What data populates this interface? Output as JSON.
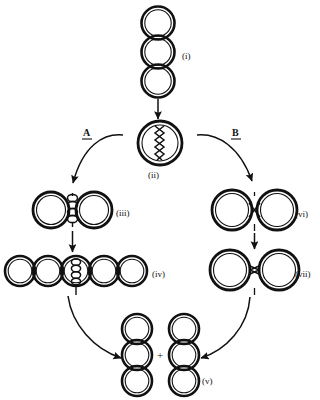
{
  "figure": {
    "background_color": "#ffffff",
    "ink_color": "#111111",
    "width": 320,
    "height": 400
  },
  "branches": [
    {
      "id": "A",
      "label": "A",
      "underlined": true,
      "side": "left"
    },
    {
      "id": "B",
      "label": "B",
      "underlined": true,
      "side": "right"
    }
  ],
  "stages": [
    {
      "id": "i",
      "label": "(i)",
      "label_x": 190,
      "label_y": 60,
      "kind": "vertical-chain",
      "description": "vertical chain of three double-ring circles",
      "circle_count": 3,
      "center_x": 158,
      "center_y": 52,
      "radius": 20
    },
    {
      "id": "ii",
      "label": "(ii)",
      "label_x": 150,
      "label_y": 175,
      "kind": "paired-rings-zigzag",
      "description": "two fused double-rings joined by a zig-zag crossover junction",
      "circle_count": 2,
      "center_x": 160,
      "center_y": 143,
      "radius": 27
    },
    {
      "id": "iii",
      "label": "(iii)",
      "label_x": 120,
      "label_y": 213,
      "kind": "paired-rings-ladder",
      "description": "two double-rings joined by a vertical ladder of linked loops",
      "circle_count": 2,
      "center_x": 72,
      "center_y": 210,
      "radius": 22
    },
    {
      "id": "iv",
      "label": "(iv)",
      "label_x": 155,
      "label_y": 274,
      "kind": "horizontal-chain-ladder",
      "description": "horizontal chain of five double-rings with a ladder junction at centre",
      "circle_count": 5,
      "center_x": 76,
      "center_y": 271,
      "radius": 19
    },
    {
      "id": "vi",
      "label": "(vi)",
      "label_x": 297,
      "label_y": 214,
      "kind": "paired-rings-cross",
      "description": "two touching double-rings with a small X crossing point",
      "circle_count": 2,
      "center_x": 255,
      "center_y": 210,
      "radius": 24
    },
    {
      "id": "vii",
      "label": "(vii)",
      "label_x": 297,
      "label_y": 274,
      "kind": "paired-rings-pinch",
      "description": "two double-rings meeting at a narrow pinch point",
      "circle_count": 2,
      "center_x": 255,
      "center_y": 270,
      "radius": 24
    },
    {
      "id": "v",
      "label": "(v)",
      "label_x": 205,
      "label_y": 380,
      "kind": "two-vertical-chains",
      "description": "two separate vertical chains of three double-rings joined by a plus sign",
      "circle_count": 6,
      "center_x": 160,
      "center_y": 355,
      "radius": 18
    }
  ],
  "plus_sign": {
    "text": "+",
    "x": 160,
    "y": 352
  },
  "arrows": [
    {
      "id": "arrow-i-to-ii",
      "from": "i",
      "to": "ii",
      "style": "straight",
      "direction": "down"
    },
    {
      "id": "arrow-ii-to-iii",
      "from": "ii",
      "to": "iii",
      "style": "curved",
      "direction": "down-left",
      "branch": "A"
    },
    {
      "id": "arrow-iii-to-iv",
      "from": "iii",
      "to": "iv",
      "style": "straight",
      "direction": "down"
    },
    {
      "id": "arrow-iv-to-v",
      "from": "iv",
      "to": "v",
      "style": "curved",
      "direction": "down-right"
    },
    {
      "id": "arrow-ii-to-vi",
      "from": "ii",
      "to": "vi",
      "style": "curved",
      "direction": "down-right",
      "branch": "B"
    },
    {
      "id": "arrow-vi-to-vii",
      "from": "vi",
      "to": "vii",
      "style": "straight",
      "direction": "down"
    },
    {
      "id": "arrow-vii-to-v",
      "from": "vii",
      "to": "v",
      "style": "curved",
      "direction": "down-left"
    }
  ]
}
